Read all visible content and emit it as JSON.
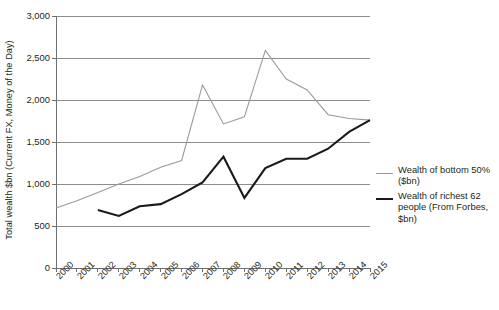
{
  "chart_data": {
    "type": "line",
    "title": "",
    "subtitle": "",
    "xlabel": "",
    "ylabel": "Total wealth $bn (Current FX, Money of the Day)",
    "x": [
      2000,
      2001,
      2002,
      2003,
      2004,
      2005,
      2006,
      2007,
      2008,
      2009,
      2010,
      2011,
      2012,
      2013,
      2014,
      2015
    ],
    "categories": [
      "2000",
      "2001",
      "2002",
      "2003",
      "2004",
      "2005",
      "2006",
      "2007",
      "2008",
      "2009",
      "2010",
      "2011",
      "2012",
      "2013",
      "2014",
      "2015"
    ],
    "xlim": [
      2000,
      2015
    ],
    "ylim": [
      0,
      3000
    ],
    "yticks": [
      0,
      500,
      1000,
      1500,
      2000,
      2500,
      3000
    ],
    "ytick_labels": [
      "0",
      "500",
      "1,000",
      "1,500",
      "2,000",
      "2,500",
      "3,000"
    ],
    "grid": true,
    "grid_axis": "y",
    "legend_position": "right",
    "series": [
      {
        "name": "Wealth of bottom 50% ($bn)",
        "color": "#9a9a9a",
        "width": 1.1,
        "values": [
          715,
          800,
          900,
          1000,
          1090,
          1200,
          1280,
          2180,
          1715,
          1800,
          2590,
          2250,
          2120,
          1825,
          1780,
          1760
        ]
      },
      {
        "name": "Wealth of richest 62 people (From Forbes, $bn)",
        "color": "#1a1a1a",
        "width": 2.1,
        "values": [
          null,
          null,
          690,
          620,
          735,
          760,
          880,
          1020,
          1325,
          835,
          1190,
          1300,
          1300,
          1420,
          1620,
          1760
        ]
      }
    ]
  },
  "legend": {
    "items": [
      {
        "label": "Wealth of bottom 50% ($bn)",
        "color": "#9a9a9a",
        "thickness": "1.2px"
      },
      {
        "label": "Wealth of richest 62 people (From Forbes, $bn)",
        "color": "#1a1a1a",
        "thickness": "2.2px"
      }
    ]
  },
  "axes": {
    "y_title": "Total wealth $bn (Current FX, Money of the Day)",
    "axis_color": "#6f6f6f",
    "grid_color": "#8d8d8d"
  }
}
